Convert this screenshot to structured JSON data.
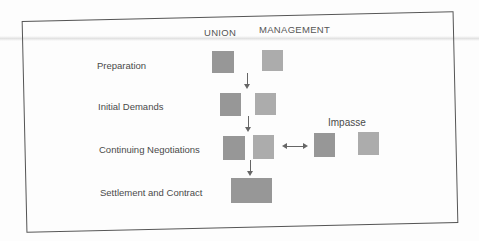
{
  "headers": {
    "union": "UNION",
    "management": "MANAGEMENT"
  },
  "stages": [
    {
      "label": "Preparation"
    },
    {
      "label": "Initial Demands"
    },
    {
      "label": "Continuing Negotiations"
    },
    {
      "label": "Settlement and Contract"
    }
  ],
  "impasse": {
    "label": "Impasse"
  },
  "colors": {
    "union_box": "#979797",
    "management_box": "#acacac",
    "text": "#4a4a4a",
    "frame": "#555555"
  }
}
